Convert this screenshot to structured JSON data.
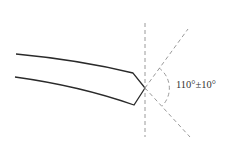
{
  "diagram": {
    "type": "blade-tip-angle",
    "angle_label": "110°±10°",
    "colors": {
      "outline": "#2a2a2a",
      "construction": "#9a9a9a",
      "text": "#333333",
      "background": "#ffffff"
    },
    "geometry": {
      "tip": [
        145,
        88
      ],
      "upper_edge": [
        [
          16,
          54
        ],
        [
          133,
          73
        ],
        [
          145,
          88
        ]
      ],
      "lower_edge": [
        [
          15,
          77
        ],
        [
          134,
          105
        ],
        [
          145,
          88
        ]
      ],
      "vertical_axis": [
        [
          145,
          23
        ],
        [
          145,
          137
        ]
      ],
      "upper_ray_end": [
        188,
        29
      ],
      "lower_ray_end": [
        190,
        137
      ],
      "arc_radius": 25
    }
  }
}
